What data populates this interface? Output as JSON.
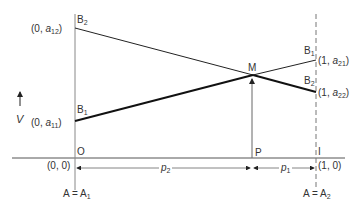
{
  "diagram": {
    "axis_label_v": "V",
    "origin_label": "O",
    "point_p_label": "P",
    "point_i_label": "I",
    "point_m_label": "M",
    "coords": {
      "origin": "(0, 0)",
      "unit": "(1, 0)",
      "a12": {
        "prefix": "(0, ",
        "var": "a",
        "sub": "12",
        "suffix": ")"
      },
      "a11": {
        "prefix": "(0, ",
        "var": "a",
        "sub": "11",
        "suffix": ")"
      },
      "a21": {
        "prefix": "(1, ",
        "var": "a",
        "sub": "21",
        "suffix": ")"
      },
      "a22": {
        "prefix": "(1, ",
        "var": "a",
        "sub": "22",
        "suffix": ")"
      }
    },
    "strategies": {
      "b1": {
        "letter": "B",
        "sub": "1"
      },
      "b2": {
        "letter": "B",
        "sub": "2"
      }
    },
    "left_axis_label": {
      "text": "A = A",
      "sub": "1"
    },
    "right_axis_label": {
      "text": "A = A",
      "sub": "2"
    },
    "p1": {
      "var": "p",
      "sub": "1"
    },
    "p2": {
      "var": "p",
      "sub": "2"
    },
    "line_color": "#111111",
    "axis_color": "#555555"
  }
}
